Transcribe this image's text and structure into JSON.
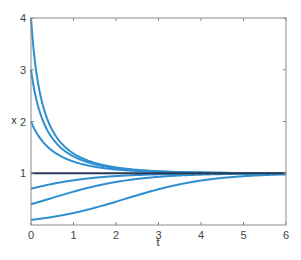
{
  "chart_data": {
    "type": "line",
    "title": "",
    "xlabel": "t",
    "ylabel": "x",
    "xlim": [
      0,
      6
    ],
    "ylim": [
      0,
      4
    ],
    "xticks": [
      "0",
      "1",
      "2",
      "3",
      "4",
      "5",
      "6"
    ],
    "yticks": [
      "1",
      "2",
      "3",
      "4"
    ],
    "grid": false,
    "legend": null,
    "model": "logistic solutions x(t) = x0*e^t / (1 - x0 + x0*e^t)",
    "series": [
      {
        "name": "x0=4",
        "initial": 4,
        "color": "#2e8fd0"
      },
      {
        "name": "x0=3",
        "initial": 3,
        "color": "#2e8fd0"
      },
      {
        "name": "x0=2",
        "initial": 2,
        "color": "#2e8fd0"
      },
      {
        "name": "x0=0.7",
        "initial": 0.7,
        "color": "#2e8fd0"
      },
      {
        "name": "x0=0.4",
        "initial": 0.4,
        "color": "#2e8fd0"
      },
      {
        "name": "x0=0.1",
        "initial": 0.1,
        "color": "#2e8fd0"
      },
      {
        "name": "equilibrium x=1",
        "initial": 1,
        "color": "#2a3a55"
      }
    ]
  }
}
